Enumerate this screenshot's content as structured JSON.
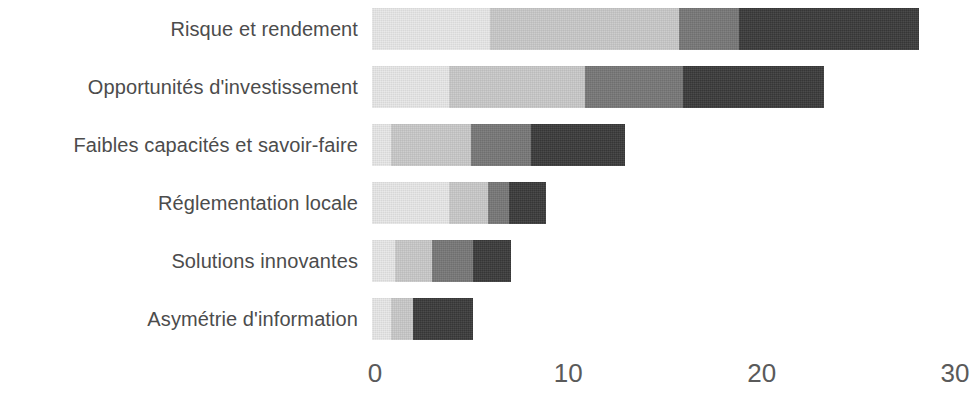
{
  "chart_data": {
    "type": "bar",
    "orientation": "horizontal",
    "stacked": true,
    "title": "",
    "subtitle": "",
    "xlabel": "",
    "ylabel": "",
    "xlim": [
      0,
      30
    ],
    "xticks": [
      0,
      10,
      20,
      30
    ],
    "xtick_labels": [
      "0",
      "10",
      "20",
      "30"
    ],
    "grid": false,
    "legend": "none",
    "categories": [
      "Risque et rendement",
      "Opportunités d'investissement",
      "Faibles capacités et savoir-faire",
      "Réglementation locale",
      "Solutions innovantes",
      "Asymétrie d'information"
    ],
    "series": [
      {
        "name": "Segment 1",
        "color": "#e8e8e8",
        "values": [
          6.1,
          4.0,
          1.0,
          4.0,
          1.2,
          1.0
        ]
      },
      {
        "name": "Segment 2",
        "color": "#c9c9c9",
        "values": [
          9.8,
          7.0,
          4.1,
          2.0,
          1.9,
          1.1
        ]
      },
      {
        "name": "Segment 3",
        "color": "#777777",
        "values": [
          3.1,
          5.1,
          3.1,
          1.1,
          2.1,
          0.0
        ]
      },
      {
        "name": "Segment 4",
        "color": "#3a3a3a",
        "values": [
          9.3,
          7.3,
          4.9,
          1.9,
          2.0,
          3.1
        ]
      }
    ],
    "totals": [
      28.3,
      23.4,
      13.1,
      9.0,
      7.2,
      5.2
    ]
  },
  "colors": {
    "background": "#ffffff",
    "label_text": "#4c4c4c",
    "tick_text": "#5a5a5a",
    "series": [
      "#e8e8e8",
      "#c9c9c9",
      "#777777",
      "#3a3a3a"
    ]
  }
}
